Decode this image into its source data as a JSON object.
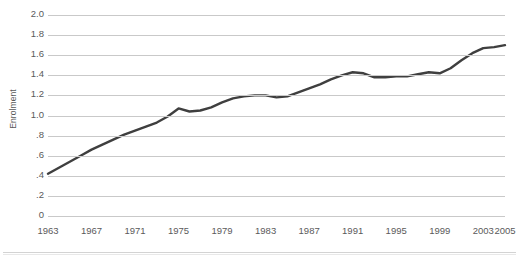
{
  "chart_data": {
    "type": "line",
    "title": "",
    "xlabel": "",
    "ylabel": "Enrolment",
    "ylim": [
      0,
      2.0
    ],
    "xlim": [
      1963,
      2005
    ],
    "grid": true,
    "legend": "none",
    "ytick_labels": [
      "2.0",
      "1.8",
      "1.6",
      "1.4",
      "1.2",
      "1.0",
      ".8",
      ".6",
      ".4",
      ".2",
      "0"
    ],
    "ytick_values": [
      2.0,
      1.8,
      1.6,
      1.4,
      1.2,
      1.0,
      0.8,
      0.6,
      0.4,
      0.2,
      0
    ],
    "xtick_labels": [
      "1963",
      "1967",
      "1971",
      "1975",
      "1979",
      "1983",
      "1987",
      "1991",
      "1995",
      "1999",
      "2003",
      "2005"
    ],
    "xtick_values": [
      1963,
      1967,
      1971,
      1975,
      1979,
      1983,
      1987,
      1991,
      1995,
      1999,
      2003,
      2005
    ],
    "series": [
      {
        "name": "Enrolment",
        "color": "#3f3f3f",
        "x": [
          1963,
          1964,
          1965,
          1966,
          1967,
          1968,
          1969,
          1970,
          1971,
          1972,
          1973,
          1974,
          1975,
          1976,
          1977,
          1978,
          1979,
          1980,
          1981,
          1982,
          1983,
          1984,
          1985,
          1986,
          1987,
          1988,
          1989,
          1990,
          1991,
          1992,
          1993,
          1994,
          1995,
          1996,
          1997,
          1998,
          1999,
          2000,
          2001,
          2002,
          2003,
          2004,
          2005
        ],
        "values": [
          0.42,
          0.48,
          0.54,
          0.6,
          0.66,
          0.71,
          0.76,
          0.81,
          0.85,
          0.89,
          0.93,
          0.99,
          1.07,
          1.04,
          1.05,
          1.08,
          1.13,
          1.17,
          1.19,
          1.2,
          1.2,
          1.18,
          1.19,
          1.23,
          1.27,
          1.31,
          1.36,
          1.4,
          1.43,
          1.42,
          1.38,
          1.38,
          1.39,
          1.39,
          1.41,
          1.43,
          1.42,
          1.47,
          1.55,
          1.62,
          1.67,
          1.68,
          1.7
        ]
      }
    ]
  }
}
